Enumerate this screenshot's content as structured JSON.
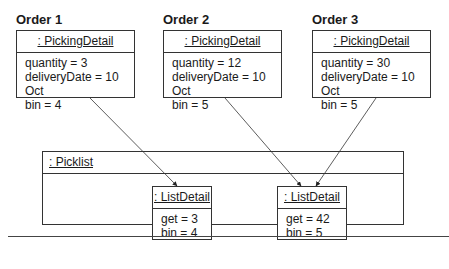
{
  "orders": [
    {
      "label": "Order 1",
      "object": ": PickingDetail",
      "attrs": [
        "quantity = 3",
        "deliveryDate = 10 Oct",
        "bin = 4"
      ]
    },
    {
      "label": "Order 2",
      "object": ": PickingDetail",
      "attrs": [
        "quantity = 12",
        "deliveryDate = 10 Oct",
        "bin = 5"
      ]
    },
    {
      "label": "Order 3",
      "object": ": PickingDetail",
      "attrs": [
        "quantity = 30",
        "deliveryDate = 10 Oct",
        "bin = 5"
      ]
    }
  ],
  "picklist": {
    "object": ": Picklist",
    "details": [
      {
        "object": ": ListDetail",
        "attrs": [
          "get = 3",
          "bin = 4"
        ]
      },
      {
        "object": ": ListDetail",
        "attrs": [
          "get = 42",
          "bin = 5"
        ]
      }
    ]
  },
  "links": [
    {
      "from": "Order 1",
      "to": "ListDetail 1"
    },
    {
      "from": "Order 2",
      "to": "ListDetail 2"
    },
    {
      "from": "Order 3",
      "to": "ListDetail 2"
    }
  ]
}
